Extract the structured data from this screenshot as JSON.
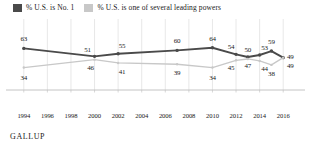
{
  "legend": {
    "entries": [
      {
        "label": "% U.S. is No. 1",
        "color": "#4a4a4a",
        "icon": "square-swatch"
      },
      {
        "label": "% U.S. is one of several leading powers",
        "color": "#c8c8c8",
        "icon": "square-swatch"
      }
    ]
  },
  "source": {
    "label": "GALLUP"
  },
  "chart_data": {
    "type": "line",
    "title": "",
    "xlabel": "",
    "ylabel": "",
    "xlim": [
      1993,
      2017
    ],
    "ylim": [
      0,
      100
    ],
    "grid": true,
    "legend_position": "top-left",
    "x_ticks": [
      1994,
      1996,
      1998,
      2000,
      2002,
      2004,
      2006,
      2008,
      2010,
      2012,
      2014,
      2016
    ],
    "series": [
      {
        "name": "% U.S. is No. 1",
        "color": "#4a4a4a",
        "x": [
          1994,
          2000,
          2002,
          2007,
          2010,
          2012,
          2013,
          2014,
          2015,
          2016
        ],
        "values": [
          63,
          51,
          55,
          60,
          64,
          54,
          50,
          53,
          59,
          49
        ],
        "labels": [
          "63",
          "51",
          "55",
          "60",
          "64",
          "54",
          "50",
          "53",
          "59",
          "49"
        ]
      },
      {
        "name": "% U.S. is one of several leading powers",
        "color": "#c8c8c8",
        "x": [
          1994,
          2000,
          2002,
          2007,
          2010,
          2012,
          2013,
          2014,
          2015,
          2016
        ],
        "values": [
          34,
          46,
          41,
          39,
          34,
          45,
          47,
          44,
          38,
          49
        ],
        "labels": [
          "34",
          "46",
          "41",
          "39",
          "34",
          "45",
          "47",
          "44",
          "38",
          "49"
        ]
      }
    ]
  }
}
